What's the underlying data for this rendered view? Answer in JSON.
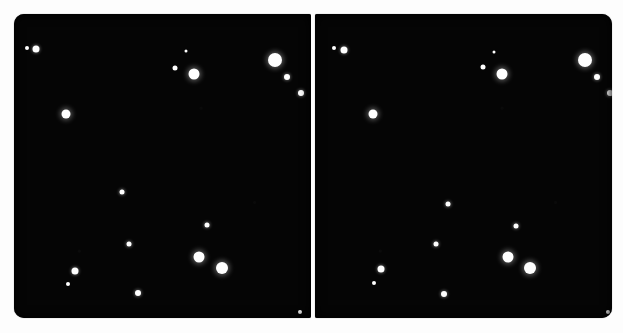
{
  "figure": {
    "kind": "stereo-pair-star-field",
    "caption": "Stereo pair of a photographic star field: two nearly identical black sky frames side by side.",
    "background_color": "#fdfdfd",
    "sky_color": "#050505",
    "star_color": "#ffffff",
    "gutter_color": "#fefefe"
  },
  "panels": [
    {
      "id": "left-frame",
      "name": "left-sky-frame",
      "label": "Left stereo frame",
      "x": 14,
      "y": 14,
      "width": 297,
      "height": 304,
      "star_count": 18,
      "stars": [
        {
          "id": "L01",
          "cx": 27,
          "cy": 48,
          "d": 4,
          "halo": "none"
        },
        {
          "id": "L02",
          "cx": 36,
          "cy": 49,
          "d": 7,
          "halo": "soft"
        },
        {
          "id": "L03",
          "cx": 186,
          "cy": 51,
          "d": 3,
          "halo": "none"
        },
        {
          "id": "L04",
          "cx": 175,
          "cy": 68,
          "d": 5,
          "halo": "none"
        },
        {
          "id": "L05",
          "cx": 194,
          "cy": 74,
          "d": 11,
          "halo": "strong"
        },
        {
          "id": "L06",
          "cx": 275,
          "cy": 60,
          "d": 14,
          "halo": "strong"
        },
        {
          "id": "L07",
          "cx": 287,
          "cy": 77,
          "d": 6,
          "halo": "soft"
        },
        {
          "id": "L08",
          "cx": 301,
          "cy": 93,
          "d": 6,
          "halo": "soft"
        },
        {
          "id": "L09",
          "cx": 66,
          "cy": 114,
          "d": 9,
          "halo": "strong"
        },
        {
          "id": "L10",
          "cx": 122,
          "cy": 192,
          "d": 5,
          "halo": "soft"
        },
        {
          "id": "L11",
          "cx": 207,
          "cy": 225,
          "d": 5,
          "halo": "soft"
        },
        {
          "id": "L12",
          "cx": 129,
          "cy": 244,
          "d": 5,
          "halo": "soft"
        },
        {
          "id": "L13",
          "cx": 199,
          "cy": 257,
          "d": 11,
          "halo": "strong"
        },
        {
          "id": "L14",
          "cx": 222,
          "cy": 268,
          "d": 12,
          "halo": "strong"
        },
        {
          "id": "L15",
          "cx": 75,
          "cy": 271,
          "d": 7,
          "halo": "soft"
        },
        {
          "id": "L16",
          "cx": 68,
          "cy": 284,
          "d": 4,
          "halo": "none"
        },
        {
          "id": "L17",
          "cx": 138,
          "cy": 293,
          "d": 6,
          "halo": "soft"
        },
        {
          "id": "L18",
          "cx": 300,
          "cy": 312,
          "d": 4,
          "halo": "none"
        }
      ]
    },
    {
      "id": "right-frame",
      "name": "right-sky-frame",
      "label": "Right stereo frame",
      "x": 315,
      "y": 14,
      "width": 297,
      "height": 304,
      "star_count": 18,
      "stars": [
        {
          "id": "R01",
          "cx": 334,
          "cy": 48,
          "d": 4,
          "halo": "none"
        },
        {
          "id": "R02",
          "cx": 344,
          "cy": 50,
          "d": 7,
          "halo": "soft"
        },
        {
          "id": "R03",
          "cx": 494,
          "cy": 52,
          "d": 3,
          "halo": "none"
        },
        {
          "id": "R04",
          "cx": 483,
          "cy": 67,
          "d": 5,
          "halo": "none"
        },
        {
          "id": "R05",
          "cx": 502,
          "cy": 74,
          "d": 11,
          "halo": "strong"
        },
        {
          "id": "R06",
          "cx": 585,
          "cy": 60,
          "d": 14,
          "halo": "strong"
        },
        {
          "id": "R07",
          "cx": 597,
          "cy": 77,
          "d": 6,
          "halo": "soft"
        },
        {
          "id": "R08",
          "cx": 610,
          "cy": 93,
          "d": 6,
          "halo": "soft"
        },
        {
          "id": "R09",
          "cx": 373,
          "cy": 114,
          "d": 9,
          "halo": "strong"
        },
        {
          "id": "R10",
          "cx": 448,
          "cy": 204,
          "d": 5,
          "halo": "soft"
        },
        {
          "id": "R11",
          "cx": 516,
          "cy": 226,
          "d": 5,
          "halo": "soft"
        },
        {
          "id": "R12",
          "cx": 436,
          "cy": 244,
          "d": 5,
          "halo": "soft"
        },
        {
          "id": "R13",
          "cx": 508,
          "cy": 257,
          "d": 11,
          "halo": "strong"
        },
        {
          "id": "R14",
          "cx": 530,
          "cy": 268,
          "d": 12,
          "halo": "strong"
        },
        {
          "id": "R15",
          "cx": 381,
          "cy": 269,
          "d": 7,
          "halo": "soft"
        },
        {
          "id": "R16",
          "cx": 374,
          "cy": 283,
          "d": 4,
          "halo": "none"
        },
        {
          "id": "R17",
          "cx": 444,
          "cy": 294,
          "d": 6,
          "halo": "soft"
        },
        {
          "id": "R18",
          "cx": 608,
          "cy": 312,
          "d": 4,
          "halo": "none"
        }
      ]
    }
  ]
}
